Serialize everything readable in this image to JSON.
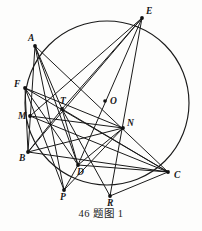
{
  "figure": {
    "caption": "46 题图 1",
    "shape": "circle-with-inscribed-polygon-chords",
    "stroke_color": "#1a1a1a",
    "background_color": "#fdfdfc",
    "circle": {
      "cx": 107,
      "cy": 103,
      "r": 82,
      "label": "circumscribed circle"
    },
    "center": {
      "name": "O",
      "label": "O",
      "x": 105,
      "y": 101,
      "label_x": 110,
      "label_y": 104
    },
    "points": [
      {
        "name": "A",
        "label": "A",
        "x": 35,
        "y": 46,
        "label_x": 28,
        "label_y": 41,
        "on_circle": true
      },
      {
        "name": "E",
        "label": "E",
        "x": 142,
        "y": 18,
        "label_x": 146,
        "label_y": 14,
        "on_circle": true
      },
      {
        "name": "F",
        "label": "F",
        "x": 25,
        "y": 88,
        "label_x": 14,
        "label_y": 87,
        "on_circle": true
      },
      {
        "name": "M",
        "label": "M",
        "x": 30,
        "y": 116,
        "label_x": 18,
        "label_y": 119,
        "on_circle": true
      },
      {
        "name": "B",
        "label": "B",
        "x": 28,
        "y": 152,
        "label_x": 19,
        "label_y": 161,
        "on_circle": true
      },
      {
        "name": "P",
        "label": "P",
        "x": 64,
        "y": 190,
        "label_x": 60,
        "label_y": 200,
        "on_circle": true
      },
      {
        "name": "R",
        "label": "R",
        "x": 110,
        "y": 196,
        "label_x": 107,
        "label_y": 206,
        "on_circle": true
      },
      {
        "name": "C",
        "label": "C",
        "x": 168,
        "y": 172,
        "label_x": 174,
        "label_y": 178,
        "on_circle": true
      },
      {
        "name": "T",
        "label": "T",
        "x": 62,
        "y": 109,
        "label_x": 60,
        "label_y": 104,
        "on_circle": false
      },
      {
        "name": "N",
        "label": "N",
        "x": 123,
        "y": 128,
        "label_x": 127,
        "label_y": 126,
        "on_circle": false
      },
      {
        "name": "D",
        "label": "D",
        "x": 78,
        "y": 165,
        "label_x": 77,
        "label_y": 175,
        "on_circle": false
      }
    ],
    "segments": [
      [
        "A",
        "B"
      ],
      [
        "A",
        "D"
      ],
      [
        "A",
        "C"
      ],
      [
        "A",
        "T"
      ],
      [
        "A",
        "P"
      ],
      [
        "E",
        "B"
      ],
      [
        "E",
        "D"
      ],
      [
        "E",
        "R"
      ],
      [
        "E",
        "T"
      ],
      [
        "E",
        "M"
      ],
      [
        "F",
        "C"
      ],
      [
        "F",
        "N"
      ],
      [
        "F",
        "D"
      ],
      [
        "F",
        "B"
      ],
      [
        "F",
        "P"
      ],
      [
        "B",
        "N"
      ],
      [
        "B",
        "C"
      ],
      [
        "B",
        "T"
      ],
      [
        "M",
        "N"
      ],
      [
        "M",
        "C"
      ],
      [
        "D",
        "C"
      ],
      [
        "D",
        "N"
      ],
      [
        "D",
        "P"
      ],
      [
        "T",
        "D"
      ],
      [
        "T",
        "C"
      ],
      [
        "T",
        "R"
      ],
      [
        "P",
        "N"
      ],
      [
        "R",
        "C"
      ]
    ]
  }
}
